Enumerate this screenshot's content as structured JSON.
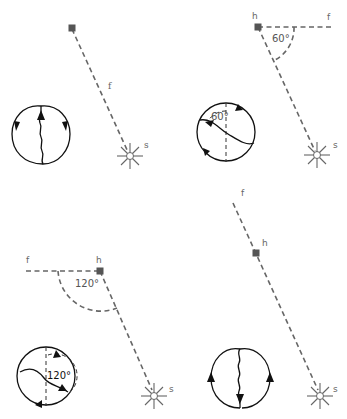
{
  "labels": {
    "food": "f",
    "hive": "h",
    "sun": "s"
  },
  "panels": [
    {
      "id": "panel-1",
      "angle_deg": 0,
      "angle_label": "",
      "description": "Food directly toward the sun; waggle run straight up"
    },
    {
      "id": "panel-2",
      "angle_deg": 60,
      "angle_label": "60°",
      "comb_angle_label": "60°",
      "description": "Food 60° left of the sun; waggle run 60° left of vertical"
    },
    {
      "id": "panel-3",
      "angle_deg": 120,
      "angle_label": "120°",
      "comb_angle_label": "120°",
      "description": "Food 120° left of the sun; waggle run 120° from vertical"
    },
    {
      "id": "panel-4",
      "angle_deg": 180,
      "angle_label": "",
      "description": "Food directly away from the sun; waggle run straight down"
    }
  ],
  "colors": {
    "line": "#666666",
    "comb": "#111111",
    "hive": "#555555"
  }
}
